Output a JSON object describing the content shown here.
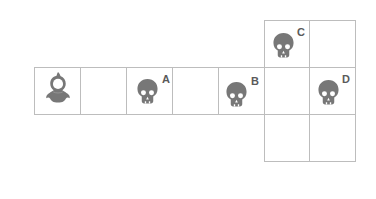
{
  "diagram": {
    "colors": {
      "grid_line": "#bdbdbd",
      "icon_fill": "#777777",
      "label": "#5a5a5a",
      "background": "#ffffff"
    },
    "cells": [
      {
        "id": "r1c1",
        "row": "middle",
        "col": 1,
        "content": "player"
      },
      {
        "id": "r1c2",
        "row": "middle",
        "col": 2,
        "content": "empty"
      },
      {
        "id": "r1c3",
        "row": "middle",
        "col": 3,
        "content": "skull",
        "label": "A"
      },
      {
        "id": "r1c4",
        "row": "middle",
        "col": 4,
        "content": "empty"
      },
      {
        "id": "r1c5",
        "row": "middle",
        "col": 5,
        "content": "skull",
        "label": "B"
      },
      {
        "id": "r1c6",
        "row": "middle",
        "col": 6,
        "content": "empty"
      },
      {
        "id": "r1c7",
        "row": "middle",
        "col": 7,
        "content": "skull",
        "label": "D"
      },
      {
        "id": "r0c6",
        "row": "top",
        "col": 6,
        "content": "skull",
        "label": "C"
      },
      {
        "id": "r0c7",
        "row": "top",
        "col": 7,
        "content": "empty"
      },
      {
        "id": "r2c6",
        "row": "bottom",
        "col": 6,
        "content": "empty"
      },
      {
        "id": "r2c7",
        "row": "bottom",
        "col": 7,
        "content": "empty"
      }
    ],
    "player": {
      "icon": "hooded-figure-icon"
    },
    "enemies": [
      {
        "label": "A",
        "icon": "skull-icon"
      },
      {
        "label": "B",
        "icon": "skull-icon"
      },
      {
        "label": "C",
        "icon": "skull-icon"
      },
      {
        "label": "D",
        "icon": "skull-icon"
      }
    ]
  }
}
